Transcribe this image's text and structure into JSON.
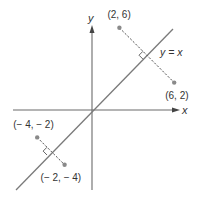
{
  "diagram": {
    "axes": {
      "x_label": "x",
      "y_label": "y"
    },
    "line": {
      "label": "y = x"
    },
    "pairs": [
      {
        "p1": {
          "x": 2,
          "y": 6,
          "label": "(2, 6)"
        },
        "p2": {
          "x": 6,
          "y": 2,
          "label": "(6, 2)"
        }
      },
      {
        "p1": {
          "x": -4,
          "y": -2,
          "label": "(− 4, − 2)"
        },
        "p2": {
          "x": -2,
          "y": -4,
          "label": "(− 2, − 4)"
        }
      }
    ]
  }
}
